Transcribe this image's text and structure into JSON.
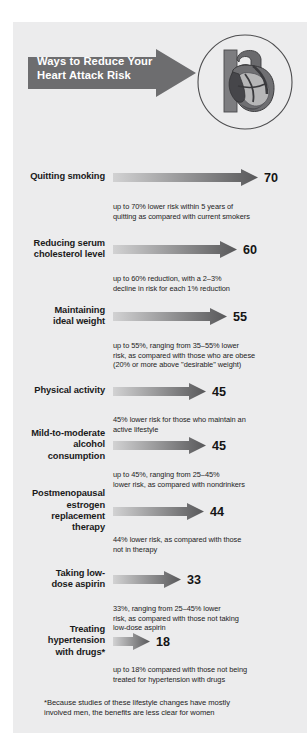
{
  "header": {
    "title_lines": [
      "Ways to Reduce Your",
      "Heart Attack Risk"
    ],
    "arrow_icon": "right-arrow-banner",
    "illustration_icon": "heart-anatomy-icon"
  },
  "colors": {
    "panel_background": "#ececed",
    "page_background": "#ffffff",
    "title_arrow_fill": "#6d6d6f",
    "title_text": "#ffffff",
    "bar_gradient_start": "#d2d2d3",
    "bar_gradient_end": "#58585a",
    "label_text": "#1a1a1a",
    "note_text": "#232323"
  },
  "chart_data": {
    "type": "bar",
    "title": "Ways to Reduce Your Heart Attack Risk",
    "xlabel": "",
    "ylabel": "",
    "xlim": [
      0,
      70
    ],
    "grid": false,
    "legend": "none",
    "orientation": "horizontal",
    "value_suffix": "%",
    "categories": [
      "Quitting smoking",
      "Reducing serum cholesterol level",
      "Maintaining ideal weight",
      "Physical activity",
      "Mild-to-moderate alcohol consumption",
      "Postmenopausal estrogen replacement therapy",
      "Taking low-dose aspirin",
      "Treating hypertension with drugs*"
    ],
    "values": [
      70,
      60,
      55,
      45,
      45,
      44,
      33,
      18
    ],
    "footnote": "*Because studies of these lifestyle changes have mostly involved men, the benefits are less clear for women"
  },
  "rows": [
    {
      "label_lines": [
        "Quitting smoking"
      ],
      "value": "70",
      "note_lines": [
        "up to 70% lower risk within 5 years of",
        "quitting as compared with current smokers"
      ]
    },
    {
      "label_lines": [
        "Reducing serum",
        "cholesterol level"
      ],
      "value": "60",
      "note_lines": [
        "up to 60% reduction, with a 2–3%",
        "decline in risk for each 1% reduction"
      ]
    },
    {
      "label_lines": [
        "Maintaining",
        "ideal weight"
      ],
      "value": "55",
      "note_lines": [
        "up to 55%, ranging from 35–55% lower",
        "risk, as compared with those who are obese",
        "(20% or more above \"desirable\" weight)"
      ]
    },
    {
      "label_lines": [
        "Physical activity"
      ],
      "value": "45",
      "note_lines": [
        "45% lower risk for those who maintain an",
        "active lifestyle"
      ]
    },
    {
      "label_lines": [
        "Mild-to-moderate",
        "alcohol",
        "consumption"
      ],
      "value": "45",
      "note_lines": [
        "up to 45%, ranging from 25–45%",
        "lower risk, as compared with nondrinkers"
      ]
    },
    {
      "label_lines": [
        "Postmenopausal",
        "estrogen",
        "replacement",
        "therapy"
      ],
      "value": "44",
      "note_lines": [
        "44% lower risk, as compared with those",
        "not in therapy"
      ]
    },
    {
      "label_lines": [
        "Taking low-",
        "dose aspirin"
      ],
      "value": "33",
      "note_lines": [
        "33%, ranging from 25–45% lower",
        "risk, as compared with those not taking",
        "low-dose aspirin"
      ]
    },
    {
      "label_lines": [
        "Treating",
        "hypertension",
        "with drugs*"
      ],
      "value": "18",
      "note_lines": [
        "up to 18% compared with those not being",
        "treated for hypertension with drugs"
      ]
    }
  ],
  "footnote_lines": [
    "*Because studies of these lifestyle changes have mostly",
    "involved men, the benefits are less clear for women"
  ]
}
